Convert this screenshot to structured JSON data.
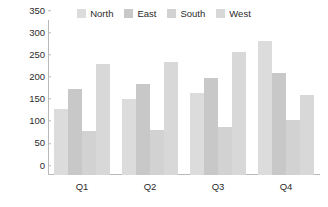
{
  "chart_data": {
    "type": "bar",
    "title": "",
    "subtitle": "",
    "xlabel": "",
    "ylabel": "",
    "categories": [
      "Q1",
      "Q2",
      "Q3",
      "Q4"
    ],
    "series": [
      {
        "name": "North",
        "values": [
          150,
          172,
          185,
          302
        ],
        "color": "#dcdcdc"
      },
      {
        "name": "East",
        "values": [
          195,
          205,
          218,
          230
        ],
        "color": "#c8c8c8"
      },
      {
        "name": "South",
        "values": [
          100,
          102,
          108,
          125
        ],
        "color": "#d2d2d2"
      },
      {
        "name": "West",
        "values": [
          250,
          256,
          278,
          180
        ],
        "color": "#d8d8d8"
      }
    ],
    "ylim": [
      0,
      350
    ],
    "yticks": [
      0,
      50,
      100,
      150,
      200,
      250,
      300,
      350
    ],
    "ytick_labels": [
      "0",
      "50",
      "100",
      "150",
      "200",
      "250",
      "300",
      "350"
    ],
    "grid": false,
    "legend_position": "top-center",
    "axis_color": "#b9b9b9",
    "text_color": "#2b2b2b",
    "background": "#ffffff"
  },
  "legend": {
    "entries": [
      {
        "label": "North"
      },
      {
        "label": "East"
      },
      {
        "label": "South"
      },
      {
        "label": "West"
      }
    ]
  },
  "axes": {
    "y_tick_labels": [
      "350",
      "300",
      "250",
      "200",
      "150",
      "100",
      "50",
      "0"
    ],
    "x_tick_labels": [
      "Q1",
      "Q2",
      "Q3",
      "Q4"
    ]
  }
}
